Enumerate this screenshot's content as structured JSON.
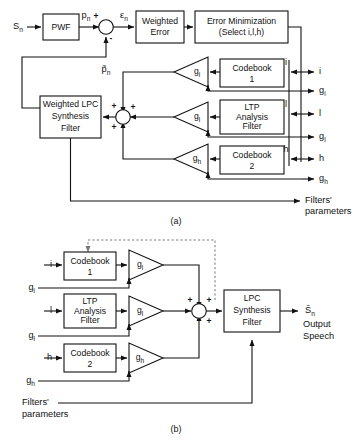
{
  "figure": {
    "name": "CELP analysis-by-synthesis encoder and decoder block diagram",
    "caption_a": "(a)",
    "caption_b": "(b)",
    "line_color": "#111111",
    "dashed_color": "#777777",
    "background": "#ffffff"
  },
  "diagram_a": {
    "label": "(a)",
    "inputs": {
      "speech_in": "S",
      "speech_in_sub": "n"
    },
    "blocks": {
      "pwf": "PWF",
      "weighted_error_line1": "Weighted",
      "weighted_error_line2": "Error",
      "error_min_line1": "Error  Minimization",
      "error_min_line2": "(Select  i,l,h)",
      "codebook1_line1": "Codebook",
      "codebook1_line2": "1",
      "ltp_line1": "LTP",
      "ltp_line2": "Analysis",
      "ltp_line3": "Filter",
      "codebook2_line1": "Codebook",
      "codebook2_line2": "2",
      "wlpc_line1": "Weighted  LPC",
      "wlpc_line2": "Synthesis",
      "wlpc_line3": "Filter"
    },
    "gains": {
      "g_i_base": "g",
      "g_i_sub": "i",
      "g_l_base": "g",
      "g_l_sub": "l",
      "g_h_base": "g",
      "g_h_sub": "h"
    },
    "signals": {
      "p_n_base": "p",
      "p_n_sub": "n",
      "eps_n_base": "ε",
      "eps_n_sub": "n",
      "p_hat_base": "p̃",
      "p_hat_sub": "n"
    },
    "signs": {
      "plus_top": "+",
      "minus_bottom": "-",
      "sum_plus_1": "+",
      "sum_plus_2": "+",
      "sum_plus_3": "+",
      "sum_plus_4": "+"
    },
    "index_labels": {
      "i": "i",
      "l": "l",
      "h": "h"
    },
    "outputs": [
      {
        "base": "i",
        "sub": "",
        "y": 72
      },
      {
        "base": "g",
        "sub": "i",
        "y": 91
      },
      {
        "base": "l",
        "sub": "",
        "y": 114
      },
      {
        "base": "g",
        "sub": "l",
        "y": 137
      },
      {
        "base": "h",
        "sub": "",
        "y": 159
      },
      {
        "base": "g",
        "sub": "h",
        "y": 179
      },
      {
        "base": "Filters'",
        "sub": "",
        "y": 201
      }
    ],
    "filters_params_line2": "parameters"
  },
  "diagram_b": {
    "label": "(b)",
    "blocks": {
      "codebook1_line1": "Codebook",
      "codebook1_line2": "1",
      "ltp_line1": "LTP",
      "ltp_line2": "Analysis",
      "ltp_line3": "Filter",
      "codebook2_line1": "Codebook",
      "codebook2_line2": "2",
      "lpc_line1": "LPC",
      "lpc_line2": "Synthesis",
      "lpc_line3": "Filter"
    },
    "gains": {
      "g_i_base": "g",
      "g_i_sub": "i",
      "g_l_base": "g",
      "g_l_sub": "l",
      "g_h_base": "g",
      "g_h_sub": "h"
    },
    "inputs": [
      {
        "base": "i",
        "sub": "",
        "y": 265
      },
      {
        "base": "g",
        "sub": "i",
        "y": 288
      },
      {
        "base": "l",
        "sub": "",
        "y": 311
      },
      {
        "base": "g",
        "sub": "l",
        "y": 336
      },
      {
        "base": "h",
        "sub": "",
        "y": 358
      },
      {
        "base": "g",
        "sub": "h",
        "y": 381
      }
    ],
    "filters_params_line1": "Filters'",
    "filters_params_line2": "parameters",
    "signs": {
      "sum_plus_1": "+",
      "sum_plus_2": "+",
      "sum_plus_3": "+",
      "sum_plus_4": "+"
    },
    "output": {
      "s_hat_base": "Ŝ",
      "s_hat_sub": "n",
      "line2": "Output",
      "line3": "Speech"
    }
  }
}
